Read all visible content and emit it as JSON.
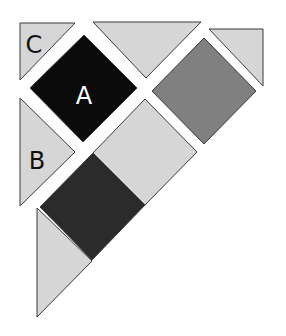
{
  "diagram": {
    "type": "tangram-puzzle",
    "colors": {
      "background": "#ffffff",
      "light": "#d6d6d6",
      "medium": "#808080",
      "dark": "#2b2b2b",
      "black": "#0b0b0b",
      "outline": "#3a3a3a",
      "label_on_light": "#111111",
      "label_on_black": "#ffffff"
    },
    "pieces": [
      {
        "id": "C",
        "label": "C",
        "shape": "small-triangle",
        "fill": "light",
        "points": "20,23 75,23 20,80",
        "label_pos": [
          34,
          46
        ]
      },
      {
        "id": "A",
        "label": "A",
        "shape": "square",
        "fill": "black",
        "points": "84,35 137,88 83,142 30,88",
        "label_pos": [
          84,
          97
        ]
      },
      {
        "id": "top-middle",
        "label": "",
        "shape": "large-triangle",
        "fill": "light",
        "points": "93,22 201,22 146,78"
      },
      {
        "id": "top-right",
        "label": "",
        "shape": "small-triangle",
        "fill": "light",
        "points": "209,29 263,29 263,86"
      },
      {
        "id": "gray-square",
        "label": "",
        "shape": "square",
        "fill": "medium",
        "points": "204,38 256,91 204,144 152,91"
      },
      {
        "id": "B",
        "label": "B",
        "shape": "medium-triangle",
        "fill": "light",
        "points": "20,98 75,152 20,206",
        "label_pos": [
          37,
          162
        ]
      },
      {
        "id": "parallelogram",
        "label": "",
        "shape": "parallelogram",
        "fill": "light",
        "points": "145,99 197,152 145,205 93,153"
      },
      {
        "id": "dark-square",
        "label": "",
        "shape": "square",
        "fill": "dark",
        "points": "93,153 145,205 92,260 40,207"
      },
      {
        "id": "bottom-triangle",
        "label": "",
        "shape": "triangle",
        "fill": "light",
        "points": "37,208 92,261 37,317"
      }
    ]
  }
}
